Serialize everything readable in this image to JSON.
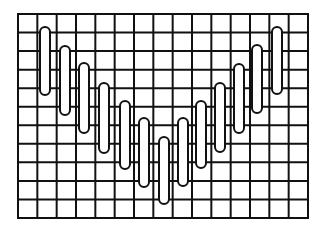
{
  "diagram": {
    "type": "grid-with-bars",
    "colors": {
      "background": "#ffffff",
      "stroke": "#111111",
      "bar_fill": "#ffffff"
    },
    "grid": {
      "left": 18,
      "top": 14,
      "right": 308,
      "bottom": 218,
      "columns": 15,
      "rows": 11,
      "line_width": 2
    },
    "bar_style": {
      "width": 10,
      "stroke_width": 2
    },
    "bars": [
      {
        "cx": 45,
        "top": 27,
        "bottom": 95
      },
      {
        "cx": 65,
        "top": 46,
        "bottom": 115
      },
      {
        "cx": 84,
        "top": 63,
        "bottom": 133
      },
      {
        "cx": 104,
        "top": 83,
        "bottom": 153
      },
      {
        "cx": 125,
        "top": 101,
        "bottom": 169
      },
      {
        "cx": 144,
        "top": 118,
        "bottom": 187
      },
      {
        "cx": 164,
        "top": 137,
        "bottom": 204
      },
      {
        "cx": 183,
        "top": 118,
        "bottom": 186
      },
      {
        "cx": 201,
        "top": 101,
        "bottom": 168
      },
      {
        "cx": 220,
        "top": 83,
        "bottom": 152
      },
      {
        "cx": 239,
        "top": 64,
        "bottom": 133
      },
      {
        "cx": 257,
        "top": 45,
        "bottom": 113
      },
      {
        "cx": 277,
        "top": 27,
        "bottom": 94
      }
    ]
  }
}
